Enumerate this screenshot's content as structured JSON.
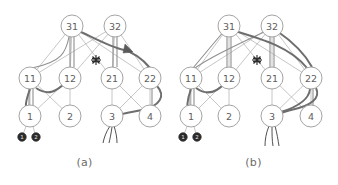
{
  "figure": {
    "background_color": "#ffffff",
    "panels": [
      {
        "id": "a",
        "caption": "(a)",
        "nodes": [
          {
            "id": "31",
            "label": "31",
            "x": 72,
            "y": 26,
            "r": 11,
            "style": "open"
          },
          {
            "id": "32",
            "label": "32",
            "x": 115,
            "y": 26,
            "r": 11,
            "style": "open"
          },
          {
            "id": "11",
            "label": "11",
            "x": 30,
            "y": 78,
            "r": 11,
            "style": "open"
          },
          {
            "id": "12",
            "label": "12",
            "x": 70,
            "y": 78,
            "r": 11,
            "style": "open"
          },
          {
            "id": "21",
            "label": "21",
            "x": 112,
            "y": 78,
            "r": 11,
            "style": "open"
          },
          {
            "id": "22",
            "label": "22",
            "x": 150,
            "y": 78,
            "r": 11,
            "style": "open"
          },
          {
            "id": "1",
            "label": "1",
            "x": 30,
            "y": 116,
            "r": 11,
            "style": "open"
          },
          {
            "id": "2",
            "label": "2",
            "x": 70,
            "y": 116,
            "r": 11,
            "style": "open"
          },
          {
            "id": "3",
            "label": "3",
            "x": 112,
            "y": 116,
            "r": 11,
            "style": "open"
          },
          {
            "id": "4",
            "label": "4",
            "x": 150,
            "y": 116,
            "r": 11,
            "style": "open"
          },
          {
            "id": "d1",
            "label": "1",
            "x": 22,
            "y": 137,
            "r": 4.2,
            "style": "filled"
          },
          {
            "id": "d2",
            "label": "2",
            "x": 36,
            "y": 137,
            "r": 4.2,
            "style": "filled"
          }
        ],
        "burst": {
          "x": 96,
          "y": 60,
          "rays": 8,
          "radius": 5
        },
        "arrow": {
          "x": 121,
          "y": 47,
          "angle": 42
        },
        "tails": [
          {
            "from": "3",
            "to_x": 103,
            "to_y": 143
          },
          {
            "from": "3",
            "to_x": 117,
            "to_y": 143
          }
        ]
      },
      {
        "id": "b",
        "caption": "(b)",
        "nodes": [
          {
            "id": "31",
            "label": "31",
            "x": 60,
            "y": 26,
            "r": 11,
            "style": "open"
          },
          {
            "id": "32",
            "label": "32",
            "x": 103,
            "y": 26,
            "r": 11,
            "style": "open"
          },
          {
            "id": "11",
            "label": "11",
            "x": 22,
            "y": 78,
            "r": 11,
            "style": "open"
          },
          {
            "id": "12",
            "label": "12",
            "x": 60,
            "y": 78,
            "r": 11,
            "style": "open"
          },
          {
            "id": "21",
            "label": "21",
            "x": 103,
            "y": 78,
            "r": 11,
            "style": "open"
          },
          {
            "id": "22",
            "label": "22",
            "x": 142,
            "y": 78,
            "r": 11,
            "style": "open"
          },
          {
            "id": "1",
            "label": "1",
            "x": 22,
            "y": 116,
            "r": 11,
            "style": "open"
          },
          {
            "id": "2",
            "label": "2",
            "x": 60,
            "y": 116,
            "r": 11,
            "style": "open"
          },
          {
            "id": "3",
            "label": "3",
            "x": 103,
            "y": 116,
            "r": 11,
            "style": "open"
          },
          {
            "id": "4",
            "label": "4",
            "x": 142,
            "y": 116,
            "r": 11,
            "style": "open"
          },
          {
            "id": "d1",
            "label": "1",
            "x": 14,
            "y": 137,
            "r": 4.2,
            "style": "filled"
          },
          {
            "id": "d2",
            "label": "2",
            "x": 28,
            "y": 137,
            "r": 4.2,
            "style": "filled"
          }
        ],
        "burst": {
          "x": 88,
          "y": 60,
          "rays": 8,
          "radius": 5
        },
        "arrow": null,
        "tails": [
          {
            "from": "3",
            "to_x": 96,
            "to_y": 146
          },
          {
            "from": "3",
            "to_x": 104,
            "to_y": 146
          },
          {
            "from": "3",
            "to_x": 110,
            "to_y": 146
          }
        ]
      }
    ],
    "colors": {
      "node_stroke": "#9a9a9a",
      "node_fill": "#ffffff",
      "node_text": "#5e5e5e",
      "filled_node": "#2b2b2b",
      "edge_light": "#b3b3b3",
      "edge_mid": "#8f8f8f",
      "edge_dark": "#6e6e6e",
      "burst": "#2d2d2d",
      "caption_text": "#6b6b6b"
    }
  }
}
